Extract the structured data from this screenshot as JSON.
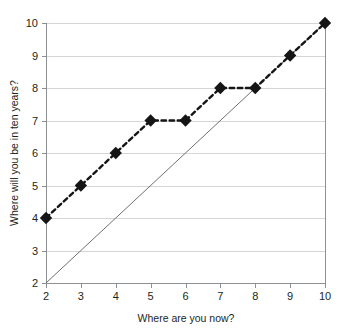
{
  "chart_data": {
    "type": "line",
    "title": "",
    "subtitle": "",
    "xlabel": "Where are you now?",
    "ylabel": "Where will you be in ten years?",
    "xlim": [
      2,
      10
    ],
    "ylim": [
      2,
      10
    ],
    "xticks": [
      2,
      3,
      4,
      5,
      6,
      7,
      8,
      9,
      10
    ],
    "yticks": [
      2,
      3,
      4,
      5,
      6,
      7,
      8,
      9,
      10
    ],
    "xtick_labels": [
      "2",
      "3",
      "4",
      "5",
      "6",
      "7",
      "8",
      "9",
      "10"
    ],
    "ytick_labels": [
      "2",
      "3",
      "4",
      "5",
      "6",
      "7",
      "8",
      "9",
      "10"
    ],
    "grid": "horizontal",
    "legend": "none",
    "series": [
      {
        "name": "responses",
        "style": "dashed-line-with-diamond-markers",
        "color": "#151515",
        "x": [
          2,
          3,
          4,
          5,
          6,
          7,
          8,
          9,
          10
        ],
        "values": [
          4,
          5,
          6,
          7,
          7,
          8,
          8,
          9,
          10
        ],
        "points": [
          {
            "x": 2,
            "y": 4
          },
          {
            "x": 3,
            "y": 5
          },
          {
            "x": 4,
            "y": 6
          },
          {
            "x": 5,
            "y": 7
          },
          {
            "x": 6,
            "y": 7
          },
          {
            "x": 7,
            "y": 8
          },
          {
            "x": 8,
            "y": 8
          },
          {
            "x": 9,
            "y": 9
          },
          {
            "x": 10,
            "y": 10
          }
        ]
      },
      {
        "name": "reference-diagonal",
        "style": "solid-thin-line",
        "color": "#6e7174",
        "x": [
          2,
          10
        ],
        "values": [
          2,
          10
        ],
        "points": [
          {
            "x": 2,
            "y": 2
          },
          {
            "x": 10,
            "y": 10
          }
        ]
      }
    ],
    "annotations": [],
    "colors": {
      "marker": "#151515",
      "series_line": "#151515",
      "reference_line": "#6e7174",
      "gridline": "#c9cbcd",
      "axis": "#8d9093",
      "text": "#231f20",
      "background": "#ffffff"
    }
  }
}
